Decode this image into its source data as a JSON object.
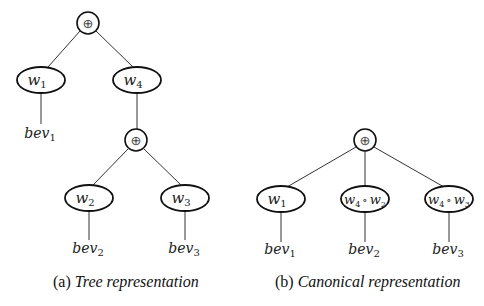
{
  "figure": {
    "subfigures": [
      {
        "id": "a",
        "caption_prefix": "(a)",
        "caption_text": "Tree representation",
        "nodes": {
          "root": {
            "type": "oplus",
            "label": "⊕"
          },
          "w1": {
            "type": "weight",
            "label": "w",
            "sub": "1"
          },
          "w4": {
            "type": "weight",
            "label": "w",
            "sub": "4"
          },
          "bev1": {
            "type": "leaf",
            "label": "bev",
            "sub": "1"
          },
          "inner": {
            "type": "oplus",
            "label": "⊕"
          },
          "w2": {
            "type": "weight",
            "label": "w",
            "sub": "2"
          },
          "w3": {
            "type": "weight",
            "label": "w",
            "sub": "3"
          },
          "bev2": {
            "type": "leaf",
            "label": "bev",
            "sub": "2"
          },
          "bev3": {
            "type": "leaf",
            "label": "bev",
            "sub": "3"
          }
        },
        "edges": [
          [
            "root",
            "w1"
          ],
          [
            "root",
            "w4"
          ],
          [
            "w1",
            "bev1"
          ],
          [
            "w4",
            "inner"
          ],
          [
            "inner",
            "w2"
          ],
          [
            "inner",
            "w3"
          ],
          [
            "w2",
            "bev2"
          ],
          [
            "w3",
            "bev3"
          ]
        ]
      },
      {
        "id": "b",
        "caption_prefix": "(b)",
        "caption_text": "Canonical representation",
        "nodes": {
          "root": {
            "type": "oplus",
            "label": "⊕"
          },
          "w1": {
            "type": "weight",
            "label": "w",
            "sub": "1"
          },
          "w4w2": {
            "type": "weight",
            "label_a": "w",
            "sub_a": "4",
            "op": "∘",
            "label_b": "w",
            "sub_b": "2"
          },
          "w4w3": {
            "type": "weight",
            "label_a": "w",
            "sub_a": "4",
            "op": "∘",
            "label_b": "w",
            "sub_b": "3"
          },
          "bev1": {
            "type": "leaf",
            "label": "bev",
            "sub": "1"
          },
          "bev2": {
            "type": "leaf",
            "label": "bev",
            "sub": "2"
          },
          "bev3": {
            "type": "leaf",
            "label": "bev",
            "sub": "3"
          }
        },
        "edges": [
          [
            "root",
            "w1"
          ],
          [
            "root",
            "w4w2"
          ],
          [
            "root",
            "w4w3"
          ],
          [
            "w1",
            "bev1"
          ],
          [
            "w4w2",
            "bev2"
          ],
          [
            "w4w3",
            "bev3"
          ]
        ]
      }
    ]
  }
}
